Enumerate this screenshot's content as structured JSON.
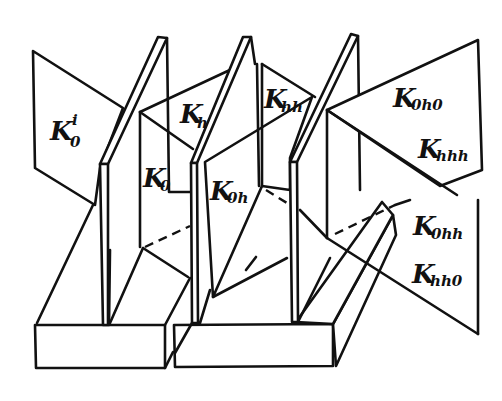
{
  "figure": {
    "labels": [
      {
        "id": "K0i",
        "main": "K",
        "sub": "0",
        "sup": "i"
      },
      {
        "id": "Kh",
        "main": "K",
        "sub": "h"
      },
      {
        "id": "K0",
        "main": "K",
        "sub": "0"
      },
      {
        "id": "Khh",
        "main": "K",
        "sub": "hh"
      },
      {
        "id": "K0h",
        "main": "K",
        "sub": "0h"
      },
      {
        "id": "K0h0",
        "main": "K",
        "sub": "0h0"
      },
      {
        "id": "Khhh",
        "main": "K",
        "sub": "hhh"
      },
      {
        "id": "K0hh",
        "main": "K",
        "sub": "0hh"
      },
      {
        "id": "Khh0",
        "main": "K",
        "sub": "hh0"
      }
    ],
    "colors": {
      "line": "#111111",
      "background": "#ffffff"
    }
  }
}
